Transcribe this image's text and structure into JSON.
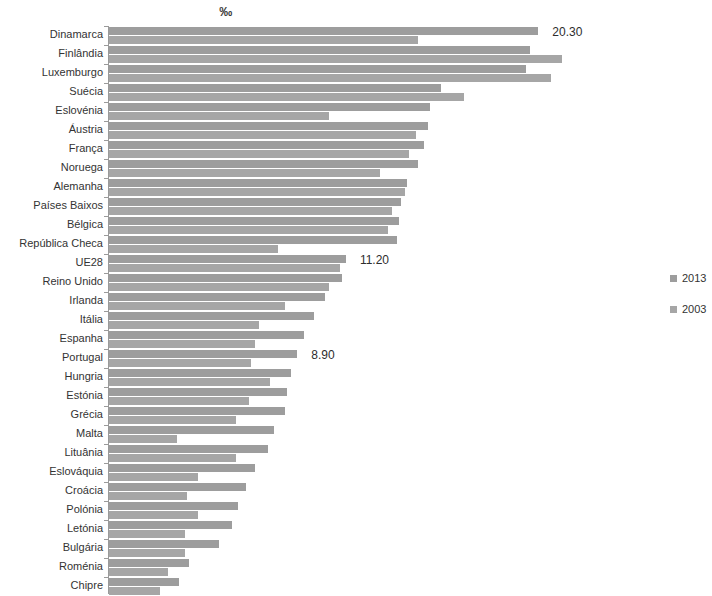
{
  "chart_data": {
    "type": "bar",
    "orientation": "horizontal",
    "title": "‰",
    "subtitle": "",
    "xlabel": "",
    "ylabel": "",
    "grid": false,
    "legend_position": "right",
    "xlim": [
      0,
      21
    ],
    "categories": [
      "Dinamarca",
      "Finlândia",
      "Luxemburgo",
      "Suécia",
      "Eslovénia",
      "Áustria",
      "França",
      "Noruega",
      "Alemanha",
      "Países Baixos",
      "Bélgica",
      "República Checa",
      "UE28",
      "Reino Unido",
      "Irlanda",
      "Itália",
      "Espanha",
      "Portugal",
      "Hungria",
      "Estónia",
      "Grécia",
      "Malta",
      "Lituânia",
      "Eslováquia",
      "Croácia",
      "Polónia",
      "Letónia",
      "Bulgária",
      "Roménia",
      "Chipre"
    ],
    "series": [
      {
        "name": "2013",
        "color": "#9d9d9d",
        "values": [
          20.3,
          19.9,
          19.7,
          15.7,
          15.2,
          15.1,
          14.9,
          14.6,
          14.1,
          13.8,
          13.7,
          13.6,
          11.2,
          11.0,
          10.2,
          9.7,
          9.2,
          8.9,
          8.6,
          8.4,
          8.3,
          7.8,
          7.5,
          6.9,
          6.5,
          6.1,
          5.8,
          5.2,
          3.8,
          3.3
        ]
      },
      {
        "name": "2003",
        "color": "#a6a6a6",
        "values": [
          14.6,
          21.4,
          20.9,
          16.8,
          10.4,
          14.5,
          14.2,
          12.8,
          14.0,
          13.4,
          13.2,
          8.0,
          10.9,
          10.4,
          8.3,
          7.1,
          6.9,
          6.7,
          7.6,
          6.6,
          6.0,
          3.2,
          6.0,
          4.2,
          3.7,
          4.2,
          3.6,
          3.6,
          2.8,
          2.4
        ]
      }
    ],
    "data_labels": [
      {
        "category": "Dinamarca",
        "series": "2013",
        "text": "20.30"
      },
      {
        "category": "UE28",
        "series": "2013",
        "text": "11.20"
      },
      {
        "category": "Portugal",
        "series": "2013",
        "text": "8.90"
      }
    ]
  },
  "legend": {
    "items": [
      {
        "label": "2013"
      },
      {
        "label": "2003"
      }
    ]
  }
}
